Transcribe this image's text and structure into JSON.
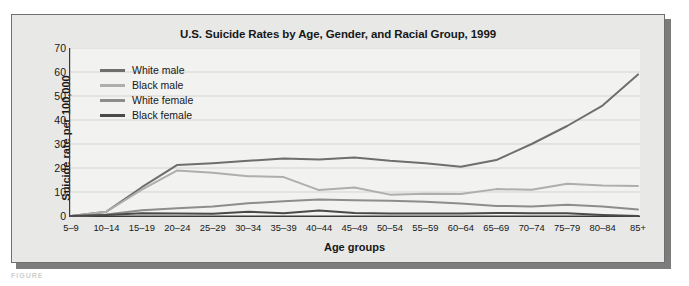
{
  "figure": {
    "title": "U.S. Suicide Rates by Age, Gender, and Racial Group, 1999",
    "caption_fragment": "FIGURE"
  },
  "axes": {
    "ylabel": "Suicide rate per 100,000",
    "xlabel": "Age groups",
    "yticks": [
      "70",
      "60",
      "50",
      "40",
      "30",
      "20",
      "10",
      "0"
    ]
  },
  "legend": {
    "items": [
      {
        "label": "White male",
        "color": "#6e6e6e"
      },
      {
        "label": "Black male",
        "color": "#aeaeae"
      },
      {
        "label": "White female",
        "color": "#8d8d8d"
      },
      {
        "label": "Black female",
        "color": "#4a4a4a"
      }
    ]
  },
  "chart_data": {
    "type": "line",
    "title": "U.S. Suicide Rates by Age, Gender, and Racial Group, 1999",
    "xlabel": "Age groups",
    "ylabel": "Suicide rate per 100,000",
    "ylim": [
      0,
      70
    ],
    "ytick_step": 10,
    "grid": true,
    "legend_position": "upper-left-inside",
    "categories": [
      "5–9",
      "10–14",
      "15–19",
      "20–24",
      "25–29",
      "30–34",
      "35–39",
      "40–44",
      "45–49",
      "50–54",
      "55–59",
      "60–64",
      "65–69",
      "70–74",
      "75–79",
      "80–84",
      "85+"
    ],
    "series": [
      {
        "name": "White male",
        "color": "#6e6e6e",
        "values": [
          0.0,
          1.8,
          12.0,
          21.3,
          22.0,
          23.0,
          24.0,
          23.5,
          24.4,
          23.0,
          22.0,
          20.5,
          23.3,
          30.0,
          37.5,
          46.0,
          59.0
        ]
      },
      {
        "name": "Black male",
        "color": "#aeaeae",
        "values": [
          0.0,
          1.8,
          11.0,
          19.0,
          18.0,
          16.6,
          16.2,
          10.8,
          11.9,
          8.9,
          9.3,
          9.2,
          11.2,
          10.9,
          13.4,
          12.7,
          12.5
        ]
      },
      {
        "name": "White female",
        "color": "#8d8d8d",
        "values": [
          0.0,
          0.6,
          2.4,
          3.2,
          4.0,
          5.3,
          6.1,
          6.9,
          6.6,
          6.4,
          5.9,
          5.2,
          4.2,
          4.0,
          4.7,
          4.0,
          2.7
        ]
      },
      {
        "name": "Black female",
        "color": "#4a4a4a",
        "values": [
          0.0,
          0.4,
          1.1,
          1.0,
          0.9,
          1.8,
          1.1,
          2.3,
          1.3,
          1.0,
          1.0,
          1.0,
          1.3,
          1.1,
          1.1,
          0.4,
          0.0
        ]
      }
    ]
  }
}
